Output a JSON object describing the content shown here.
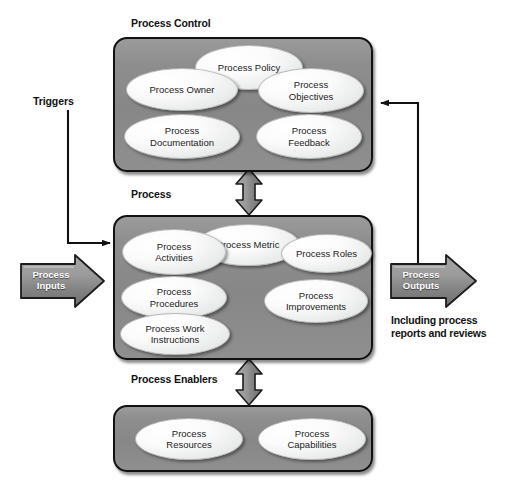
{
  "diagram": {
    "colors": {
      "box_fill": "#8e8e8e",
      "box_border": "#111111",
      "node_fill": "#f2f3f3",
      "arrow_fill": "#8a8a8a",
      "arrow_border": "#1d1d1d",
      "text": "#121212",
      "arrow_text": "#ffffff"
    }
  },
  "sections": [
    {
      "id": "process-control",
      "caption": "Process Control",
      "nodes": [
        {
          "label": "Process Policy"
        },
        {
          "label": "Process Owner"
        },
        {
          "label": "Process\nObjectives"
        },
        {
          "label": "Process\nDocumentation"
        },
        {
          "label": "Process\nFeedback"
        }
      ]
    },
    {
      "id": "process",
      "caption": "Process",
      "nodes": [
        {
          "label": "Process Metric"
        },
        {
          "label": "Process\nActivities"
        },
        {
          "label": "Process Roles"
        },
        {
          "label": "Process\nProcedures"
        },
        {
          "label": "Process\nImprovements"
        },
        {
          "label": "Process Work\nInstructions"
        }
      ]
    },
    {
      "id": "process-enablers",
      "caption": "Process Enablers",
      "nodes": [
        {
          "label": "Process\nResources"
        },
        {
          "label": "Process\nCapabilities"
        }
      ]
    }
  ],
  "flows": {
    "triggers_label": "Triggers",
    "inputs_label": "Process\nInputs",
    "outputs_label": "Process\nOutputs",
    "outputs_note": "Including process\nreports and reviews"
  },
  "node_labels": {
    "process_policy": "Process Policy",
    "process_owner": "Process Owner",
    "process_objectives": "Process\nObjectives",
    "process_documentation": "Process\nDocumentation",
    "process_feedback": "Process\nFeedback",
    "process_metric": "Process Metric",
    "process_activities": "Process\nActivities",
    "process_roles": "Process Roles",
    "process_procedures": "Process\nProcedures",
    "process_improvements": "Process\nImprovements",
    "process_work_instructions": "Process Work\nInstructions",
    "process_resources": "Process\nResources",
    "process_capabilities": "Process\nCapabilities"
  }
}
